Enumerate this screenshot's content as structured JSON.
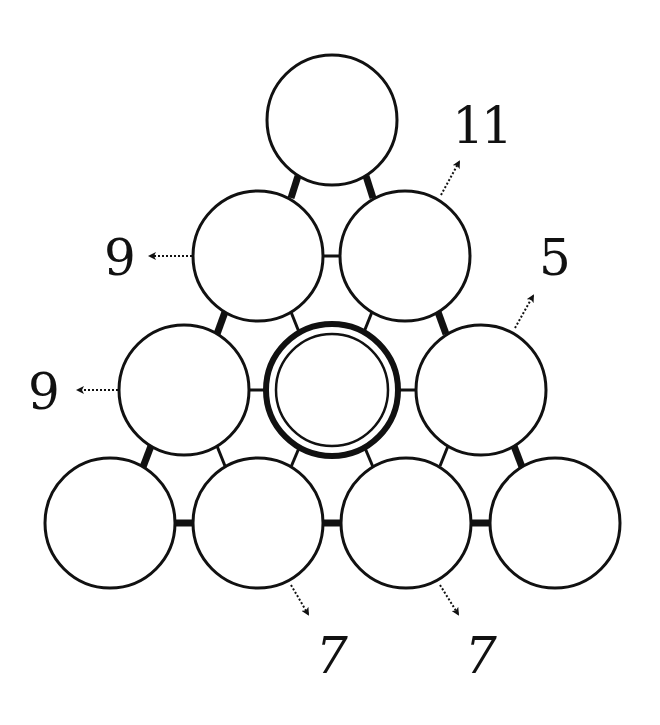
{
  "puzzle": {
    "type": "number-pyramid",
    "stroke_color": "#111111",
    "background": "#ffffff",
    "circle_radius": 65,
    "circles": [
      {
        "id": "r1c1",
        "row": 1,
        "cx": 332,
        "cy": 120,
        "value": "",
        "highlight": false
      },
      {
        "id": "r2c1",
        "row": 2,
        "cx": 258,
        "cy": 256,
        "value": "",
        "highlight": false
      },
      {
        "id": "r2c2",
        "row": 2,
        "cx": 405,
        "cy": 256,
        "value": "",
        "highlight": false
      },
      {
        "id": "r3c1",
        "row": 3,
        "cx": 184,
        "cy": 390,
        "value": "",
        "highlight": false
      },
      {
        "id": "r3c2",
        "row": 3,
        "cx": 332,
        "cy": 390,
        "value": "",
        "highlight": true
      },
      {
        "id": "r3c3",
        "row": 3,
        "cx": 481,
        "cy": 390,
        "value": "",
        "highlight": false
      },
      {
        "id": "r4c1",
        "row": 4,
        "cx": 110,
        "cy": 523,
        "value": "",
        "highlight": false
      },
      {
        "id": "r4c2",
        "row": 4,
        "cx": 258,
        "cy": 523,
        "value": "",
        "highlight": false
      },
      {
        "id": "r4c3",
        "row": 4,
        "cx": 406,
        "cy": 523,
        "value": "",
        "highlight": false
      },
      {
        "id": "r4c4",
        "row": 4,
        "cx": 555,
        "cy": 523,
        "value": "",
        "highlight": false
      }
    ],
    "clues": [
      {
        "label": "11",
        "x": 481,
        "y": 126,
        "target": "r2c2",
        "direction": "up-right"
      },
      {
        "label": "9",
        "x": 120,
        "y": 258,
        "target": "r2c1",
        "direction": "left"
      },
      {
        "label": "5",
        "x": 555,
        "y": 258,
        "target": "r3c3",
        "direction": "up-right"
      },
      {
        "label": "9",
        "x": 44,
        "y": 392,
        "target": "r3c1",
        "direction": "left"
      },
      {
        "label": "7",
        "x": 332,
        "y": 656,
        "target": "r4c2",
        "direction": "down-right"
      },
      {
        "label": "7",
        "x": 481,
        "y": 656,
        "target": "r4c3",
        "direction": "down-right"
      }
    ]
  }
}
